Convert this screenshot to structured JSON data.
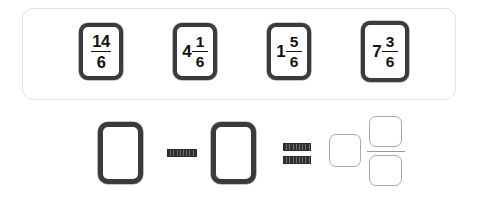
{
  "exercise": {
    "type": "fraction-drag-and-drop",
    "background_color": "#ffffff"
  },
  "tray": {
    "name": "fraction-card-tray",
    "border_color": "#e2e2e2",
    "cards": [
      {
        "id": "card-14-6",
        "kind": "improper-fraction",
        "whole": "",
        "numerator": "14",
        "denominator": "6",
        "text": "14/6"
      },
      {
        "id": "card-4-1-6",
        "kind": "mixed-number",
        "whole": "4",
        "numerator": "1",
        "denominator": "6",
        "text": "4 1/6"
      },
      {
        "id": "card-1-5-6",
        "kind": "mixed-number",
        "whole": "1",
        "numerator": "5",
        "denominator": "6",
        "text": "1 5/6"
      },
      {
        "id": "card-7-3-6",
        "kind": "mixed-number",
        "whole": "7",
        "numerator": "3",
        "denominator": "6",
        "text": "7 3/6"
      }
    ]
  },
  "equation": {
    "name": "fraction-subtraction-equation",
    "minuend_slot": {
      "name": "minuend-drop-slot",
      "value": ""
    },
    "subtrahend_slot": {
      "name": "subtrahend-drop-slot",
      "value": ""
    },
    "minus_operator": {
      "symbol": "−",
      "color": "#2f2f2f"
    },
    "equals_operator": {
      "symbol": "=",
      "color": "#2f2f2f"
    },
    "answer": {
      "name": "answer-mixed-number",
      "whole_slot": {
        "name": "answer-whole-slot",
        "value": ""
      },
      "numerator_slot": {
        "name": "answer-numerator-slot",
        "value": ""
      },
      "denominator_slot": {
        "name": "answer-denominator-slot",
        "value": ""
      },
      "border_color": "#a8a8a8"
    }
  }
}
